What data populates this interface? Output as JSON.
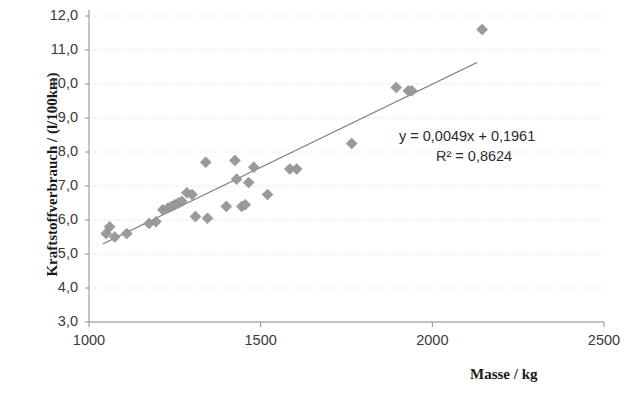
{
  "chart_data": {
    "type": "scatter",
    "title": "",
    "xlabel": "Masse / kg",
    "ylabel": "Kraftstoffverbrauch / (l/100km)",
    "xlim": [
      1000,
      2500
    ],
    "ylim": [
      3.0,
      12.0
    ],
    "xticks": [
      1000,
      1500,
      2000,
      2500
    ],
    "xtick_labels": [
      "1000",
      "1500",
      "2000",
      "2500"
    ],
    "yticks": [
      3.0,
      4.0,
      5.0,
      6.0,
      7.0,
      8.0,
      9.0,
      10.0,
      11.0,
      12.0
    ],
    "ytick_labels": [
      "3,0",
      "4,0",
      "5,0",
      "6,0",
      "7,0",
      "8,0",
      "9,0",
      "10,0",
      "11,0",
      "12,0"
    ],
    "grid": true,
    "grid_axis": "y",
    "legend": null,
    "marker": "diamond",
    "marker_color": "#9a9a9a",
    "marker_size": 11,
    "series": [
      {
        "name": "Fahrzeuge",
        "points": [
          [
            1050,
            5.6
          ],
          [
            1060,
            5.8
          ],
          [
            1075,
            5.5
          ],
          [
            1110,
            5.6
          ],
          [
            1175,
            5.9
          ],
          [
            1195,
            5.95
          ],
          [
            1215,
            6.3
          ],
          [
            1230,
            6.35
          ],
          [
            1240,
            6.4
          ],
          [
            1250,
            6.45
          ],
          [
            1260,
            6.5
          ],
          [
            1270,
            6.55
          ],
          [
            1285,
            6.8
          ],
          [
            1300,
            6.75
          ],
          [
            1310,
            6.1
          ],
          [
            1340,
            7.7
          ],
          [
            1345,
            6.05
          ],
          [
            1400,
            6.4
          ],
          [
            1425,
            7.75
          ],
          [
            1430,
            7.2
          ],
          [
            1445,
            6.4
          ],
          [
            1455,
            6.45
          ],
          [
            1465,
            7.1
          ],
          [
            1480,
            7.55
          ],
          [
            1520,
            6.75
          ],
          [
            1585,
            7.5
          ],
          [
            1605,
            7.5
          ],
          [
            1765,
            8.25
          ],
          [
            1895,
            9.9
          ],
          [
            1930,
            9.8
          ],
          [
            1940,
            9.8
          ],
          [
            2145,
            11.6
          ]
        ]
      }
    ],
    "trendline": {
      "type": "linear",
      "slope": 0.0049,
      "intercept": 0.1961,
      "r_squared": 0.8624,
      "equation_label": "y = 0,0049x + 0,1961",
      "r2_label": "R² = 0,8624",
      "x_start": 1040,
      "x_end": 2130,
      "color": "#7a7a7a"
    }
  },
  "axes": {
    "y_title": "Kraftstoffverbrauch / (l/100km)",
    "x_title": "Masse / kg"
  },
  "annotations": {
    "equation": "y = 0,0049x + 0,1961",
    "r_squared": "R² = 0,8624"
  },
  "colors": {
    "marker": "#9a9a9a",
    "trendline": "#7a7a7a",
    "grid": "#d9d9d9",
    "axis": "#8c8c8c",
    "text": "#2b2b2b"
  }
}
